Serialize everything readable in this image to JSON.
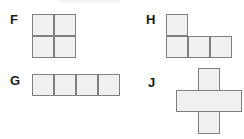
{
  "figure": {
    "type": "polyomino-shape-set",
    "background_color": "#ffffff",
    "cell_fill_color": "#f0f0f0",
    "cell_border_color": "#808080",
    "label_color": "#1a1a1a",
    "cell_size_px": 22,
    "shapes": [
      {
        "label": "F",
        "name": "square-tetromino",
        "cell_count": 4,
        "grid_cells": [
          [
            0,
            0
          ],
          [
            1,
            0
          ],
          [
            0,
            1
          ],
          [
            1,
            1
          ]
        ],
        "description": "2 by 2 square"
      },
      {
        "label": "G",
        "name": "straight-tetromino",
        "cell_count": 4,
        "grid_cells": [
          [
            0,
            0
          ],
          [
            1,
            0
          ],
          [
            2,
            0
          ],
          [
            3,
            0
          ]
        ],
        "description": "1 by 4 horizontal strip"
      },
      {
        "label": "H",
        "name": "j-tetromino",
        "cell_count": 4,
        "grid_cells": [
          [
            0,
            0
          ],
          [
            0,
            1
          ],
          [
            1,
            1
          ],
          [
            2,
            1
          ]
        ],
        "description": "L shape: one square on top left above a row of three"
      },
      {
        "label": "J",
        "name": "plus-pentomino",
        "cell_count": 5,
        "grid_cells": [
          [
            1,
            0
          ],
          [
            0,
            1
          ],
          [
            1,
            1
          ],
          [
            2,
            1
          ],
          [
            1,
            2
          ]
        ],
        "description": "plus or cross shape drawn as overlapping vertical and horizontal bars with a white centre"
      }
    ]
  }
}
